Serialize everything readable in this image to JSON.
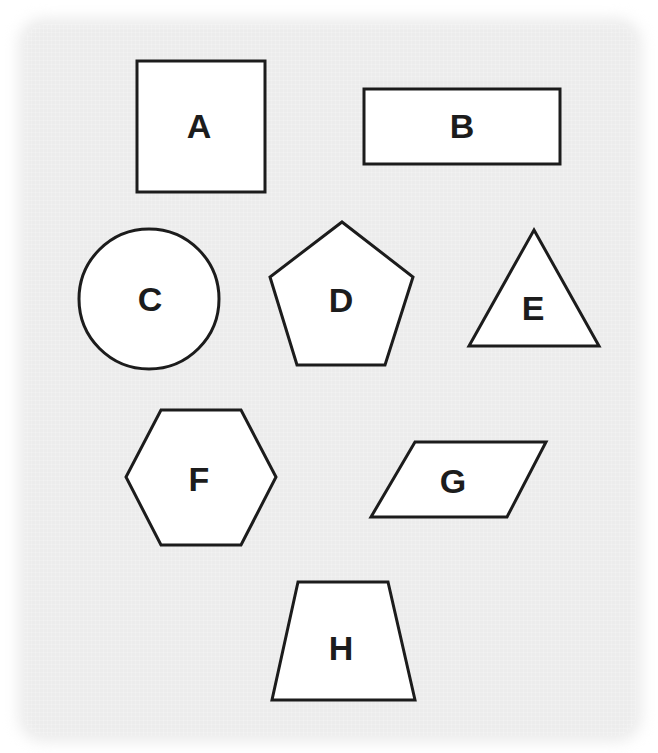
{
  "canvas": {
    "width": 658,
    "height": 753,
    "background_color": "#ffffff",
    "panel_color": "#ececec"
  },
  "style": {
    "shape_fill": "#ffffff",
    "shape_stroke": "#1c1c1c",
    "stroke_width": 3,
    "label_color": "#1c1c1c",
    "label_font_size": 34
  },
  "figure": {
    "kind": "geometric-shapes-chart",
    "shape_count": 8
  },
  "shapes": [
    {
      "id": "A",
      "label": "A",
      "name": "square",
      "geometry": "rect",
      "x": 137,
      "y": 61,
      "width": 128,
      "height": 131,
      "label_x": 199,
      "label_y": 126
    },
    {
      "id": "B",
      "label": "B",
      "name": "rectangle",
      "geometry": "rect",
      "x": 364,
      "y": 89,
      "width": 196,
      "height": 75,
      "label_x": 462,
      "label_y": 126
    },
    {
      "id": "C",
      "label": "C",
      "name": "circle",
      "geometry": "circle",
      "cx": 149,
      "cy": 299,
      "r": 70,
      "label_x": 150,
      "label_y": 299
    },
    {
      "id": "D",
      "label": "D",
      "name": "pentagon",
      "geometry": "polygon",
      "points": "342,222 413,277 385,365 297,365 270,277",
      "label_x": 341,
      "label_y": 300
    },
    {
      "id": "E",
      "label": "E",
      "name": "triangle",
      "geometry": "polygon",
      "points": "534,230 599,346 469,346",
      "label_x": 533,
      "label_y": 308
    },
    {
      "id": "F",
      "label": "F",
      "name": "hexagon",
      "geometry": "polygon",
      "points": "161,410 241,410 276,477 241,545 161,545 126,477",
      "label_x": 199,
      "label_y": 479
    },
    {
      "id": "G",
      "label": "G",
      "name": "parallelogram",
      "geometry": "polygon",
      "points": "415,442 546,442 507,517 371,517",
      "label_x": 453,
      "label_y": 481
    },
    {
      "id": "H",
      "label": "H",
      "name": "trapezoid",
      "geometry": "polygon",
      "points": "298,582 388,582 415,700 272,700",
      "label_x": 341,
      "label_y": 648
    }
  ]
}
